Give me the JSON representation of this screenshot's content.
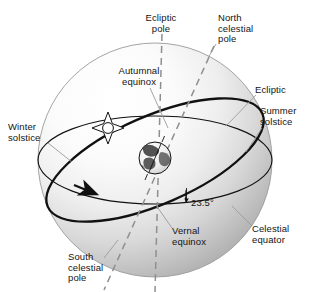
{
  "figure": {
    "type": "astronomical-diagram"
  },
  "colors": {
    "sphere_light": "#ffffff",
    "sphere_mid": "#e2e2e2",
    "sphere_dark": "#a8a8a8",
    "sphere_edge": "#9a9a9a",
    "line_dark": "#111111",
    "dashed_gray": "#8f8f8f",
    "leader_gray": "#9b9b9b",
    "text": "#141414",
    "earth_land": "#3a3a3a",
    "earth_ocean": "#f2f2f2"
  },
  "labels": {
    "ecliptic_pole": "Ecliptic\npole",
    "north_celestial_pole": "North\ncelestial\npole",
    "autumnal_equinox": "Autumnal\nequinox",
    "ecliptic": "Ecliptic",
    "summer_solstice": "Summer\nsolstice",
    "winter_solstice": "Winter\nsolstice",
    "tilt_angle": "23.5°",
    "vernal_equinox": "Vernal\nequinox",
    "celestial_equator": "Celestial\nequator",
    "south_celestial_pole": "South\ncelestial\npole"
  },
  "icons": {
    "sun": "sun-symbol",
    "earth": "earth-globe"
  },
  "geometry": {
    "sphere_center_x": 155,
    "sphere_center_y": 160,
    "sphere_radius": 117,
    "earth_center_x": 155,
    "earth_center_y": 158,
    "earth_radius": 16,
    "sun_center_x": 108,
    "sun_center_y": 128,
    "obliquity_degrees": 23.5
  }
}
